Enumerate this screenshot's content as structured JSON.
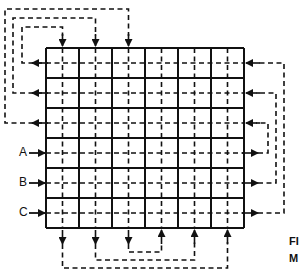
{
  "diagram": {
    "type": "mesh-interconnect-grid",
    "grid": {
      "rows": 6,
      "cols": 6,
      "left": 46,
      "top": 48,
      "cell_w": 33,
      "cell_h": 30
    },
    "row_labels": [
      {
        "row": 3,
        "text": "A"
      },
      {
        "row": 4,
        "text": "B"
      },
      {
        "row": 5,
        "text": "C"
      }
    ],
    "top_connections": [
      {
        "col": 0,
        "to_row": 0,
        "level_y": 27,
        "side_x": 22
      },
      {
        "col": 1,
        "to_row": 1,
        "level_y": 18,
        "side_x": 13
      },
      {
        "col": 2,
        "to_row": 2,
        "level_y": 9,
        "side_x": 5
      }
    ],
    "right_connections": [
      {
        "from_row": 3,
        "to_row": 2,
        "side_x": 268
      },
      {
        "from_row": 4,
        "to_row": 1,
        "side_x": 276
      },
      {
        "from_row": 5,
        "to_row": 0,
        "side_x": 284
      }
    ],
    "bottom_connections": [
      {
        "from_col": 2,
        "to_col": 3,
        "level_y": 252
      },
      {
        "from_col": 1,
        "to_col": 4,
        "level_y": 260
      },
      {
        "from_col": 0,
        "to_col": 5,
        "level_y": 268
      }
    ],
    "caption": {
      "line1": "FI",
      "line2": "M"
    },
    "colors": {
      "line": "#111111",
      "background": "#ffffff"
    }
  }
}
